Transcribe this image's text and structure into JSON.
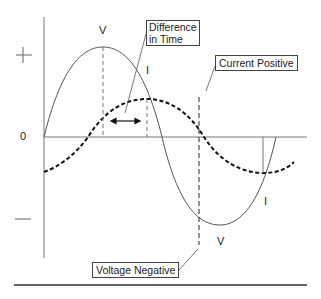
{
  "diagram": {
    "axis": {
      "plus_label": "+",
      "zero_label": "0",
      "minus_label": "—"
    },
    "curves": {
      "voltage": {
        "label_top": "V",
        "label_bottom": "V",
        "style": "solid",
        "color": "#555555"
      },
      "current": {
        "label_top": "I",
        "label_bottom": "I",
        "style": "dashed",
        "color": "#111111"
      }
    },
    "callouts": {
      "difference_in_time": {
        "line1": "Difference",
        "line2": "in Time"
      },
      "current_positive": "Current Positive",
      "voltage_negative": "Voltage Negative"
    },
    "arrow": "double-headed-arrow"
  }
}
